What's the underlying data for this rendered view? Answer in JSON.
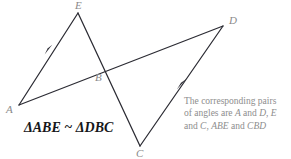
{
  "figure": {
    "background_color": "#ffffff",
    "stroke_color": "#2b2b33",
    "label_color": "#8a8a8a",
    "note_color": "#8d8d8d",
    "statement_color": "#16171a",
    "vertices": {
      "A": {
        "label": "A",
        "x": 19,
        "y": 105
      },
      "B": {
        "label": "B",
        "x": 105,
        "y": 69
      },
      "C": {
        "label": "C",
        "x": 140,
        "y": 146
      },
      "D": {
        "label": "D",
        "x": 223,
        "y": 26
      },
      "E": {
        "label": "E",
        "x": 78,
        "y": 13
      }
    },
    "segments": [
      {
        "name": "segment-A-to-D",
        "from": "A",
        "to": "D"
      },
      {
        "name": "segment-E-to-C",
        "from": "E",
        "to": "C"
      },
      {
        "name": "segment-A-to-E",
        "from": "A",
        "to": "E"
      },
      {
        "name": "segment-C-to-D",
        "from": "C",
        "to": "D"
      }
    ],
    "arrow_markers": [
      {
        "name": "arrow-marker-on-AE",
        "x": 49,
        "y": 51,
        "direction": "toward-E"
      },
      {
        "name": "arrow-marker-on-CD",
        "x": 182,
        "y": 85,
        "direction": "toward-D"
      }
    ]
  },
  "statement": {
    "text": "ΔABE ~ ΔDBC"
  },
  "note": {
    "line1": "The corresponding pairs",
    "line2_prefix": "of angles are ",
    "line2_a": "A",
    "line2_mid": " and ",
    "line2_d": "D",
    "line2_sep": ", ",
    "line2_e": "E",
    "line3_prefix": "and ",
    "line3_c": "C",
    "line3_sep": ", ",
    "line3_abe": "ABE",
    "line3_mid": " and ",
    "line3_cbd": "CBD"
  }
}
